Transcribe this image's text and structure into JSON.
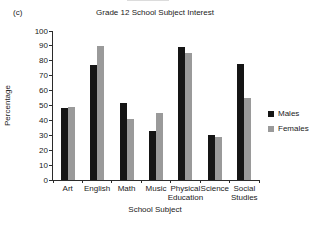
{
  "panel_label": "(c)",
  "chart_data": {
    "type": "bar",
    "title": "Grade 12 School Subject Interest",
    "xlabel": "School Subject",
    "ylabel": "Percentage",
    "categories": [
      "Art",
      "English",
      "Math",
      "Music",
      "Physical Education",
      "Science",
      "Social Studies"
    ],
    "series": [
      {
        "name": "Males",
        "color": "#151515",
        "values": [
          48,
          77,
          52,
          33,
          89,
          30,
          78
        ]
      },
      {
        "name": "Females",
        "color": "#9a9a9a",
        "values": [
          49,
          90,
          41,
          45,
          85,
          29,
          55
        ]
      }
    ],
    "ylim": [
      0,
      100
    ],
    "ytick_step": 10,
    "grid": false,
    "legend_position": "right"
  }
}
